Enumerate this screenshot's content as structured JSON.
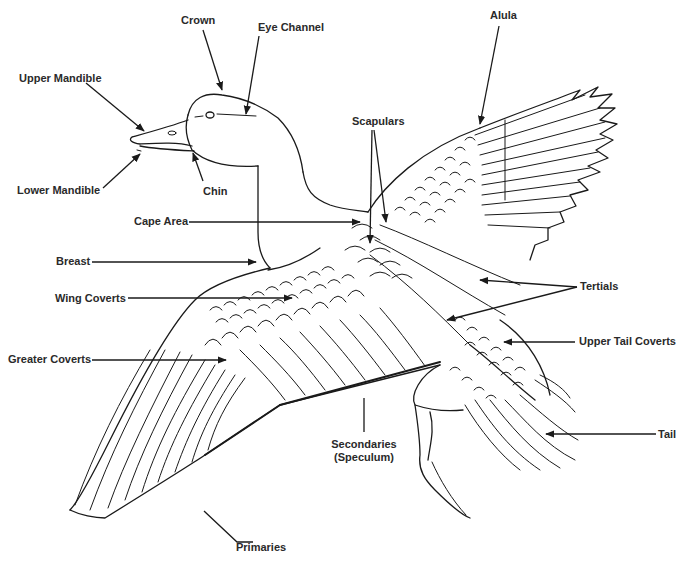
{
  "diagram": {
    "labels": {
      "crown": "Crown",
      "eye_channel": "Eye Channel",
      "alula": "Alula",
      "upper_mandible": "Upper Mandible",
      "scapulars": "Scapulars",
      "lower_mandible": "Lower Mandible",
      "chin": "Chin",
      "cape_area": "Cape Area",
      "breast": "Breast",
      "tertials": "Tertials",
      "wing_coverts": "Wing Coverts",
      "upper_tail_coverts": "Upper Tail Coverts",
      "greater_coverts": "Greater Coverts",
      "tail": "Tail",
      "secondaries_line1": "Secondaries",
      "secondaries_line2": "(Speculum)",
      "primaries": "Primaries"
    },
    "colors": {
      "ink": "#1a1a1a",
      "background": "#ffffff"
    }
  }
}
